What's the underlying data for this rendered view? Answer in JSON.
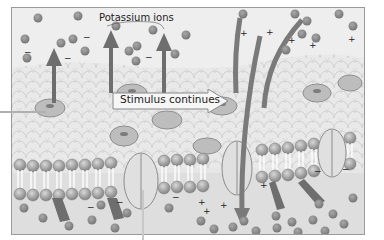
{
  "diagram": {
    "title_label": "Potassium ions",
    "callout_label": "Stimulus continues",
    "sign_negative": "−",
    "sign_positive": "+",
    "colors": {
      "ion": "#8c8c8c",
      "membrane_head": "#9c9c9c",
      "arrow": "#6e6e6e",
      "channel": "#dcdcdc",
      "background": "#e6e6e6"
    }
  }
}
